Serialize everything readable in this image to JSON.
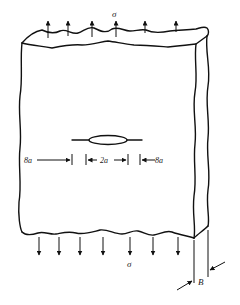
{
  "figure": {
    "labels": {
      "stress_top": "σ",
      "stress_bottom": "σ",
      "crack_length": "2a",
      "left_distance": "8a",
      "right_distance": "8a",
      "thickness": "B"
    },
    "load_arrows": {
      "top_count": 6,
      "bottom_count": 7,
      "direction_top": "up",
      "direction_bottom": "down"
    }
  }
}
